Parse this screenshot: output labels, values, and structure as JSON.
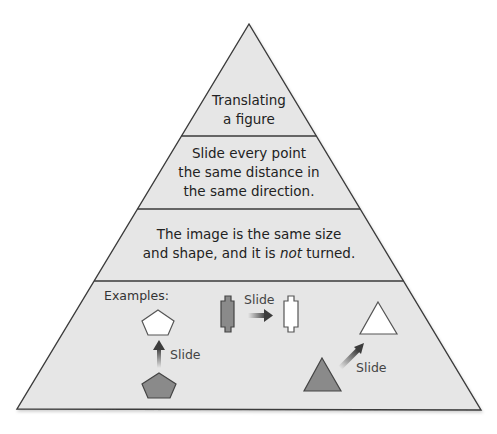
{
  "diagram": {
    "type": "pyramid",
    "colors": {
      "pyramid_fill": "#e6e6e6",
      "outline": "#3a3a3a",
      "shape_fill_dark": "#8a8a8a",
      "shape_fill_light": "#ffffff",
      "arrow": "#3c3c3c",
      "text": "#222222"
    },
    "levels": [
      {
        "id": "title",
        "lines": [
          "Translating",
          "a figure"
        ]
      },
      {
        "id": "definition",
        "lines": [
          "Slide every point",
          "the same distance in",
          "the same direction."
        ]
      },
      {
        "id": "property",
        "line1": "The image is the same size",
        "line2_prefix": "and shape, and it is ",
        "line2_italic": "not",
        "line2_suffix": " turned."
      },
      {
        "id": "examples",
        "label": "Examples:",
        "examples": [
          {
            "shape": "pentagon",
            "direction": "up",
            "arrow_label": "Slide"
          },
          {
            "shape": "notched-rectangle",
            "direction": "right",
            "arrow_label": "Slide"
          },
          {
            "shape": "triangle",
            "direction": "up-right",
            "arrow_label": "Slide"
          }
        ]
      }
    ]
  }
}
